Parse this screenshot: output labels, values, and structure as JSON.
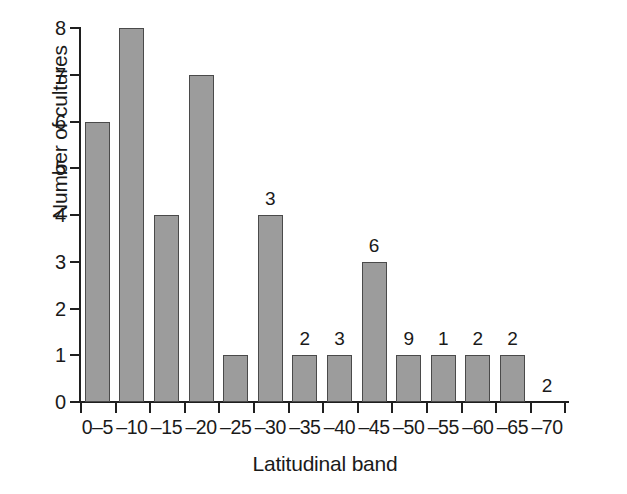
{
  "chart_data": {
    "type": "bar",
    "title": "",
    "subtitle": "",
    "xlabel": "Latitudinal band",
    "ylabel": "Number of cultures",
    "categories": [
      "0–5",
      "–10",
      "–15",
      "–20",
      "–25",
      "–30",
      "–35",
      "–40",
      "–45",
      "–50",
      "–55",
      "–60",
      "–65",
      "–70"
    ],
    "values": [
      6,
      8,
      4,
      7,
      1,
      4,
      1,
      1,
      3,
      1,
      1,
      1,
      1,
      0
    ],
    "point_labels": [
      "",
      "",
      "",
      "",
      "",
      "3",
      "2",
      "3",
      "6",
      "9",
      "1",
      "2",
      "2",
      "2"
    ],
    "ylim": [
      0,
      8
    ],
    "yticks": [
      0,
      1,
      2,
      3,
      4,
      5,
      6,
      7,
      8
    ],
    "ytick_labels": [
      "0",
      "1",
      "2",
      "3",
      "4",
      "5",
      "6",
      "7",
      "8"
    ],
    "grid": false,
    "legend": null,
    "bar_color": "#9c9c9c",
    "bar_edge_color": "#4a4a4a",
    "axis_color": "#1f1f1f",
    "background_color": "#ffffff"
  }
}
